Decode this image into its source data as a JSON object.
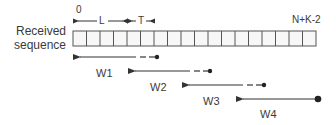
{
  "diagram": {
    "sequence_label_line1": "Received",
    "sequence_label_line2": "sequence",
    "start_index": "0",
    "end_index": "N+K-2",
    "segment_L": "L",
    "segment_T": "T",
    "cell_count": 18,
    "colors": {
      "stroke": "#333333",
      "cell_fill": "#f7f7f7",
      "cell_border": "#555555",
      "text": "#3a3a3a"
    },
    "windows": [
      {
        "label": "W1",
        "style": "solid-then-dashed",
        "end_marker": "dot"
      },
      {
        "label": "W2",
        "style": "solid-then-dashed",
        "end_marker": "dot"
      },
      {
        "label": "W3",
        "style": "solid-then-dashed",
        "end_marker": "dot"
      },
      {
        "label": "W4",
        "style": "solid",
        "end_marker": "large-dot"
      }
    ]
  }
}
